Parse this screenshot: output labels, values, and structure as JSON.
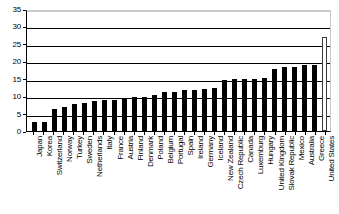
{
  "chart_data": {
    "type": "bar",
    "title": "",
    "subtitle": "",
    "xlabel": "",
    "ylabel": "",
    "ylim": [
      0,
      35
    ],
    "y_ticks": [
      0,
      5,
      10,
      15,
      20,
      25,
      30,
      35
    ],
    "grid": true,
    "legend": "none",
    "bar_color": "#000000",
    "highlight_color": "#ffffff",
    "highlight_category": "United States",
    "highlight_style": "outlined",
    "categories": [
      "Japan",
      "Korea",
      "Switzerland",
      "Norway",
      "Turkey",
      "Sweden",
      "Netherlands",
      "Italy",
      "France",
      "Austria",
      "Finland",
      "Denmark",
      "Poland",
      "Belgium",
      "Portugal",
      "Spain",
      "Ireland",
      "Germany",
      "Iceland",
      "New Zealand",
      "Czech Republic",
      "Canada",
      "Luxemburg",
      "Hungary",
      "United Kingdom",
      "Slovak Republic",
      "Mexico",
      "Australia",
      "Greece",
      "United States"
    ],
    "values": [
      2.7,
      2.7,
      6.3,
      6.9,
      7.7,
      8.0,
      8.7,
      8.8,
      9.0,
      9.1,
      9.9,
      9.9,
      10.4,
      11.1,
      11.1,
      11.8,
      11.8,
      12.1,
      12.3,
      14.7,
      14.8,
      14.8,
      14.8,
      15.2,
      17.9,
      18.5,
      18.5,
      18.8,
      19.0,
      27.1
    ]
  }
}
